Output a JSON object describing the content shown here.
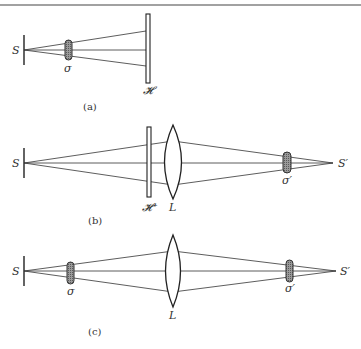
{
  "figure": {
    "panels": [
      {
        "id": "a",
        "caption": "(a)",
        "labels": {
          "source": "S",
          "object": "σ",
          "hologram": "𝓗"
        }
      },
      {
        "id": "b",
        "caption": "(b)",
        "labels": {
          "source": "S",
          "hologram": "𝓗⁺",
          "lens": "L",
          "image_object": "σ′",
          "image_source": "S′"
        }
      },
      {
        "id": "c",
        "caption": "(c)",
        "labels": {
          "source": "S",
          "object": "σ",
          "lens": "L",
          "image_object": "σ′",
          "image_source": "S′"
        }
      }
    ]
  }
}
